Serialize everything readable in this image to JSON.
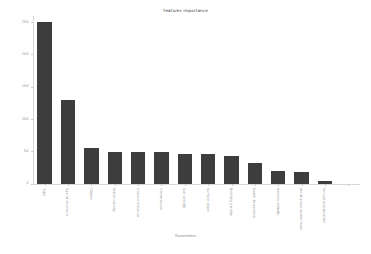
{
  "chart_data": {
    "type": "bar",
    "title": "Features importance",
    "xlabel": "Parameters",
    "ylabel": "Importance",
    "ylim": [
      0,
      260
    ],
    "yticks": [
      0,
      50,
      100,
      150,
      200,
      250
    ],
    "ytick_labels": [
      "0",
      "50",
      "100",
      "150",
      "200",
      "250"
    ],
    "grid": false,
    "legend": null,
    "bar_color": "#3d3d3d",
    "categories": [
      "Total",
      "Age of structure",
      "Citizen",
      "Water salinity",
      "Ground moisture",
      "Compression",
      "Soil density",
      "Surface slope",
      "Building density",
      "Depth to bedrock",
      "Seismic activity",
      "pH of groundwater level",
      "Annual precipitation"
    ],
    "values": [
      250,
      130,
      56,
      50,
      50,
      50,
      47,
      47,
      43,
      33,
      20,
      18,
      5
    ]
  },
  "axis": {
    "ticks_count": 14
  }
}
